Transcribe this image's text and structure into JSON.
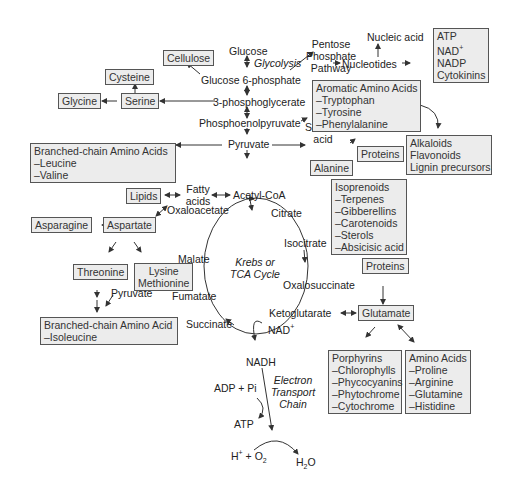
{
  "diagram": {
    "colors": {
      "box_fill": "#ececec",
      "box_border": "#555555",
      "text": "#222222",
      "line": "#333333"
    },
    "nodes": {
      "glucose": "Glucose",
      "glycolysis": "Glycolysis",
      "glucose6p": "Glucose 6-phosphate",
      "pgly3": "3-phosphoglycerate",
      "pep": "Phosphoenolpyruvate",
      "pyruvate": "Pyruvate",
      "acetylcoa": "Acetyl-CoA",
      "fatty_acids_1": "Fatty",
      "fatty_acids_2": "acids",
      "oxaloacetate": "Oxaloacetate",
      "citrate": "Citrate",
      "isocitrate": "Isocitrate",
      "oxalosuccinate": "Oxalosuccinate",
      "ketoglutarate": "Ketoglutarate",
      "succinate": "Succinate",
      "fumatate": "Fumatate",
      "malate": "Malate",
      "krebs_1": "Krebs or",
      "krebs_2": "TCA Cycle",
      "nad": "NAD+",
      "nadh": "NADH",
      "adp_pi": "ADP + Pi",
      "atp": "ATP",
      "etc_1": "Electron",
      "etc_2": "Transport",
      "etc_3": "Chain",
      "h_o2": "H+ + O2",
      "h2o": "H2O",
      "pentose_1": "Pentose",
      "pentose_2": "Phosphate",
      "pentose_3": "Pathway",
      "nucleotides": "Nucleotides",
      "nucleic_acid": "Nucleic acid",
      "shikimic_1": "Shikimic",
      "shikimic_2": "acid",
      "pyruvate_2": "Pyruvate"
    },
    "boxes": {
      "cellulose": [
        "Cellulose"
      ],
      "cysteine": [
        "Cysteine"
      ],
      "glycine": [
        "Glycine"
      ],
      "serine": [
        "Serine"
      ],
      "bcaa": [
        "Branched-chain Amino Acids",
        "–Leucine",
        "–Valine"
      ],
      "lipids": [
        "Lipids"
      ],
      "asparagine": [
        "Asparagine"
      ],
      "aspartate": [
        "Aspartate"
      ],
      "threonine": [
        "Threonine"
      ],
      "lysine_methionine": [
        "Lysine",
        "Methionine"
      ],
      "bcaa_iso": [
        "Branched-chain Amino Acid",
        "–Isoleucine"
      ],
      "atp_group": [
        "ATP",
        "NAD+",
        "NADP",
        "Cytokinins"
      ],
      "aromatic": [
        "Aromatic Amino Acids",
        "–Tryptophan",
        "–Tyrosine",
        "–Phenylalanine"
      ],
      "alkaloids": [
        "Alkaloids",
        "Flavonoids",
        "Lignin precursors"
      ],
      "proteins_1": [
        "Proteins"
      ],
      "alanine": [
        "Alanine"
      ],
      "isoprenoids": [
        "Isoprenoids",
        "–Terpenes",
        "–Gibberellins",
        "–Carotenoids",
        "–Sterols",
        "–Absicisic acid"
      ],
      "proteins_2": [
        "Proteins"
      ],
      "glutamate": [
        "Glutamate"
      ],
      "porphyrins": [
        "Porphyrins",
        "–Chlorophylls",
        "–Phycocyanins",
        "–Phytochrome",
        "–Cytochrome"
      ],
      "amino_acids": [
        "Amino Acids",
        "–Proline",
        "–Arginine",
        "–Glutamine",
        "–Histidine"
      ]
    }
  }
}
